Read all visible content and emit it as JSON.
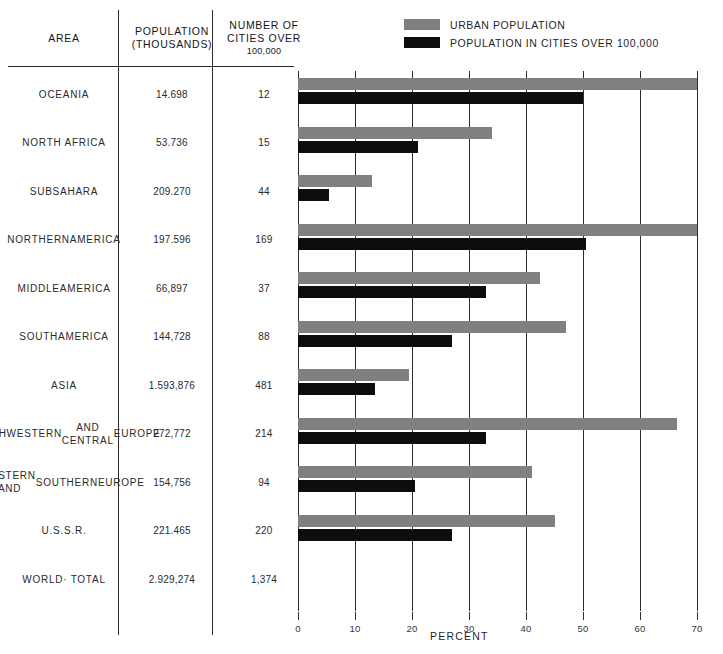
{
  "legend": {
    "items": [
      {
        "label": "URBAN POPULATION",
        "color": "#808080",
        "swatch_name": "legend-swatch-urban"
      },
      {
        "label": "POPULATION IN CITIES OVER 100,000",
        "color": "#0d0d0d",
        "swatch_name": "legend-swatch-cities"
      }
    ]
  },
  "table": {
    "headers": {
      "area": "AREA",
      "population_line1": "POPULATION",
      "population_line2": "(THOUSANDS)",
      "cities_line1": "NUMBER OF",
      "cities_line2": "CITIES OVER",
      "cities_line3": "100,000"
    },
    "rows": [
      {
        "area": "OCEANIA",
        "population": "14.698",
        "cities": "12"
      },
      {
        "area": "NORTH AFRICA",
        "population": "53.736",
        "cities": "15"
      },
      {
        "area": "SUBSAHARA",
        "population": "209.270",
        "cities": "44"
      },
      {
        "area": "NORTHERN\nAMERICA",
        "population": "197.596",
        "cities": "169"
      },
      {
        "area": "MIDDLE\nAMERICA",
        "population": "66,897",
        "cities": "37"
      },
      {
        "area": "SOUTH\nAMERICA",
        "population": "144,728",
        "cities": "88"
      },
      {
        "area": "ASIA",
        "population": "1.593,876",
        "cities": "481"
      },
      {
        "area": "NORTHWESTERN\nAND CENTRAL\nEUROPE",
        "population": "272,772",
        "cities": "214"
      },
      {
        "area": "EASTERN AND\nSOUTHERN\nEUROPE",
        "population": "154,756",
        "cities": "94"
      },
      {
        "area": "U.S.S.R.",
        "population": "221.465",
        "cities": "220"
      },
      {
        "area": "WORLD· TOTAL",
        "population": "2.929,274",
        "cities": "1,374"
      }
    ]
  },
  "chart_data": {
    "type": "bar",
    "orientation": "horizontal",
    "title": "",
    "xlabel": "PERCENT",
    "ylabel": "",
    "xlim": [
      0,
      70
    ],
    "xticks": [
      0,
      10,
      20,
      30,
      40,
      50,
      60,
      70
    ],
    "xticklabels": [
      "0",
      "10",
      "20",
      "30",
      "40",
      "50",
      "60",
      "70"
    ],
    "grid": true,
    "legend_position": "top-right",
    "categories": [
      "OCEANIA",
      "NORTH AFRICA",
      "SUBSAHARA",
      "NORTHERN AMERICA",
      "MIDDLE AMERICA",
      "SOUTH AMERICA",
      "ASIA",
      "NORTHWESTERN AND CENTRAL EUROPE",
      "EASTERN AND SOUTHERN EUROPE",
      "U.S.S.R."
    ],
    "series": [
      {
        "name": "URBAN POPULATION",
        "color": "#808080",
        "values": [
          70.0,
          34.0,
          13.0,
          70.0,
          42.5,
          47.0,
          19.5,
          66.5,
          41.0,
          45.0
        ]
      },
      {
        "name": "POPULATION IN CITIES OVER 100,000",
        "color": "#0d0d0d",
        "values": [
          50.0,
          21.0,
          5.5,
          50.5,
          33.0,
          27.0,
          13.5,
          33.0,
          20.5,
          27.0
        ]
      }
    ]
  }
}
